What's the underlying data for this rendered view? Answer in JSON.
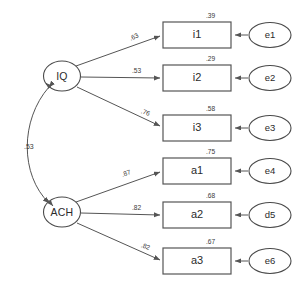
{
  "diagram": {
    "type": "sem-path-diagram",
    "title": "",
    "latent_factors": [
      {
        "id": "IQ",
        "label": "IQ"
      },
      {
        "id": "ACH",
        "label": "ACH"
      }
    ],
    "factor_correlation": {
      "from": "IQ",
      "to": "ACH",
      "label": ".53",
      "arrow": "double-headed"
    },
    "indicators": [
      {
        "id": "i1",
        "label": "i1",
        "factor": "IQ",
        "loading": ".63",
        "variance_explained": ".39",
        "error": {
          "id": "e1",
          "label": "e1"
        }
      },
      {
        "id": "i2",
        "label": "i2",
        "factor": "IQ",
        "loading": ".53",
        "variance_explained": ".29",
        "error": {
          "id": "e2",
          "label": "e2"
        }
      },
      {
        "id": "i3",
        "label": "i3",
        "factor": "IQ",
        "loading": ".76",
        "variance_explained": ".58",
        "error": {
          "id": "e3",
          "label": "e3"
        }
      },
      {
        "id": "a1",
        "label": "a1",
        "factor": "ACH",
        "loading": ".87",
        "variance_explained": ".75",
        "error": {
          "id": "e4",
          "label": "e4"
        }
      },
      {
        "id": "a2",
        "label": "a2",
        "factor": "ACH",
        "loading": ".82",
        "variance_explained": ".68",
        "error": {
          "id": "d5",
          "label": "d5"
        }
      },
      {
        "id": "a3",
        "label": "a3",
        "factor": "ACH",
        "loading": ".82",
        "variance_explained": ".67",
        "error": {
          "id": "e6",
          "label": "e6"
        }
      }
    ],
    "colors": {
      "stroke": "#555555",
      "text": "#2b2b2b",
      "background": "#ffffff"
    }
  }
}
